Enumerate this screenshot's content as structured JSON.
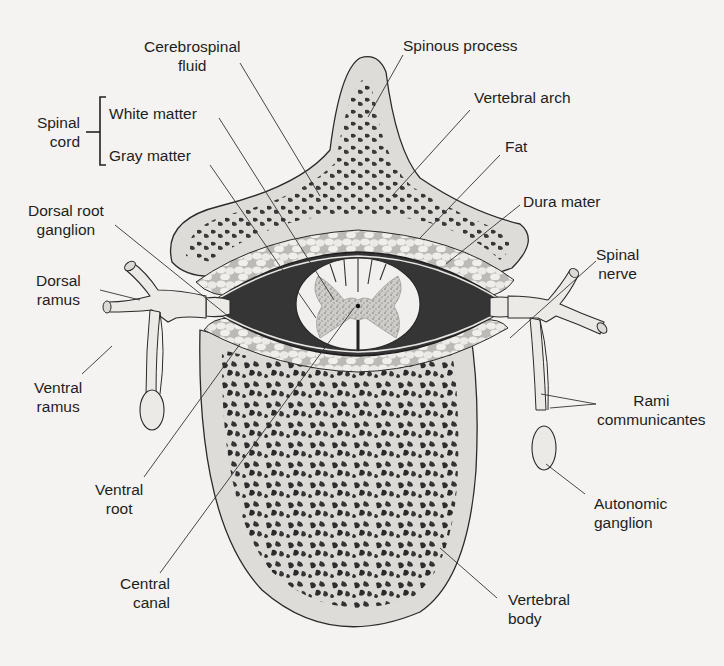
{
  "figure": {
    "colors": {
      "background": "#f4f3f1",
      "bone": "#dedcd8",
      "cancellous_spots": "#2b2b2b",
      "csf_dark": "#3a3a3a",
      "fat": "#ecebe8",
      "cord_white": "#f1f0ee",
      "gray_matter": "#bdbbb7",
      "nerve": "#ebeae7",
      "outline": "#2a2a2a",
      "leader_line": "#333333"
    },
    "labels": {
      "cerebrospinal_fluid": [
        "Cerebrospinal",
        "fluid"
      ],
      "spinous_process": "Spinous process",
      "vertebral_arch": "Vertebral arch",
      "spinal_cord_group": [
        "Spinal",
        "cord"
      ],
      "white_matter": "White matter",
      "gray_matter": "Gray matter",
      "fat": "Fat",
      "dura_mater": "Dura mater",
      "dorsal_root_ganglion": [
        "Dorsal root",
        "ganglion"
      ],
      "dorsal_ramus": [
        "Dorsal",
        "ramus"
      ],
      "spinal_nerve": [
        "Spinal",
        "nerve"
      ],
      "ventral_ramus": [
        "Ventral",
        "ramus"
      ],
      "rami_communicantes": [
        "Rami",
        "communicantes"
      ],
      "ventral_root": [
        "Ventral",
        "root"
      ],
      "autonomic_ganglion": [
        "Autonomic",
        "ganglion"
      ],
      "central_canal": [
        "Central",
        "canal"
      ],
      "vertebral_body": [
        "Vertebral",
        "body"
      ]
    }
  }
}
